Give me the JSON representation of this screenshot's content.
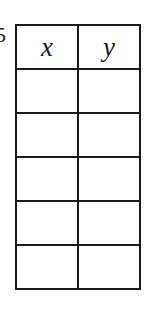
{
  "edge_fragment": "5",
  "table": {
    "headers": [
      "x",
      "y"
    ],
    "rows": [
      [
        "",
        ""
      ],
      [
        "",
        ""
      ],
      [
        "",
        ""
      ],
      [
        "",
        ""
      ],
      [
        "",
        ""
      ]
    ]
  }
}
